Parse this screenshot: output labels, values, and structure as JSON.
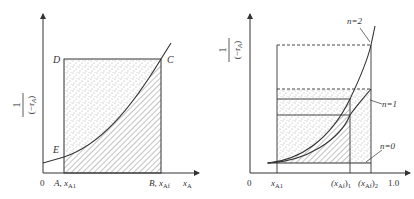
{
  "left_panel": {
    "y_axis_label_num": "1",
    "y_axis_label_den": "(−r",
    "y_axis_label_den_sub": "A",
    "y_axis_label_den_close": ")",
    "origin": "0",
    "point_D": "D",
    "point_C": "C",
    "point_E": "E",
    "tick_A": "A, x",
    "tick_A_sub": "A1",
    "tick_B": "B, x",
    "tick_B_sub": "Af",
    "x_axis_label": "x",
    "x_axis_label_sub": "A"
  },
  "right_panel": {
    "y_axis_label_num": "1",
    "y_axis_label_den": "(−r",
    "y_axis_label_den_sub": "A",
    "y_axis_label_den_close": ")",
    "origin": "0",
    "tick_xA1": "x",
    "tick_xA1_sub": "A1",
    "tick_xAf1": "(x",
    "tick_xAf1_sub": "Af",
    "tick_xAf1_close": ")",
    "tick_xAf1_idx": "1",
    "tick_xAf2": "(x",
    "tick_xAf2_sub": "Af",
    "tick_xAf2_close": ")",
    "tick_xAf2_idx": "2",
    "tick_end": "1.0",
    "curve_n2": "n=2",
    "curve_n1": "n=1",
    "curve_n0": "n=0"
  },
  "colors": {
    "line": "#333333",
    "stipple": "#555555",
    "hatch": "#666666"
  }
}
